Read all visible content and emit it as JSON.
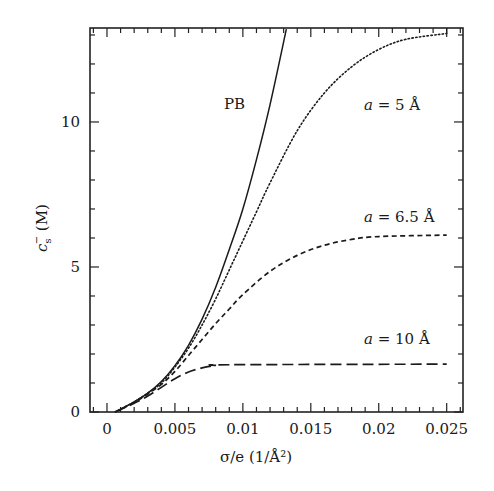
{
  "chart_data": {
    "type": "line",
    "title": "",
    "xlabel": "σ/e (1/Å²)",
    "ylabel": "c_s^− (M)",
    "xlim": [
      -0.00125,
      0.0262
    ],
    "ylim": [
      0,
      13.24
    ],
    "grid": false,
    "legend": "none (inline annotations)",
    "x_ticks": [
      0,
      0.005,
      0.01,
      0.015,
      0.02,
      0.025
    ],
    "x_tick_labels": [
      "0",
      "0.005",
      "0.01",
      "0.015",
      "0.02",
      "0.025"
    ],
    "x_minor_step": 0.001,
    "y_ticks": [
      0,
      5,
      10
    ],
    "y_tick_labels": [
      "0",
      "5",
      "10"
    ],
    "y_minor_step": 1,
    "series": [
      {
        "name": "PB",
        "style": "solid",
        "x": [
          0.0006,
          0.002,
          0.003,
          0.004,
          0.005,
          0.006,
          0.007,
          0.008,
          0.009,
          0.01,
          0.011,
          0.012,
          0.0132
        ],
        "y": [
          0,
          0.35,
          0.65,
          1.05,
          1.6,
          2.3,
          3.2,
          4.3,
          5.6,
          7.0,
          8.7,
          10.6,
          13.2
        ]
      },
      {
        "name": "a = 5 Å",
        "style": "dotted",
        "x": [
          0.0006,
          0.002,
          0.003,
          0.004,
          0.005,
          0.006,
          0.007,
          0.008,
          0.009,
          0.01,
          0.011,
          0.012,
          0.014,
          0.016,
          0.018,
          0.02,
          0.022,
          0.025
        ],
        "y": [
          0,
          0.35,
          0.65,
          1.0,
          1.55,
          2.2,
          3.0,
          3.9,
          4.9,
          5.9,
          6.9,
          7.9,
          9.7,
          11.0,
          11.9,
          12.5,
          12.85,
          13.05
        ]
      },
      {
        "name": "a = 6.5 Å",
        "style": "dashed",
        "x": [
          0.0006,
          0.002,
          0.003,
          0.004,
          0.005,
          0.006,
          0.007,
          0.008,
          0.009,
          0.01,
          0.012,
          0.014,
          0.016,
          0.018,
          0.02,
          0.025
        ],
        "y": [
          0,
          0.33,
          0.62,
          0.95,
          1.4,
          1.95,
          2.5,
          3.05,
          3.55,
          4.05,
          4.85,
          5.4,
          5.75,
          5.95,
          6.05,
          6.1
        ]
      },
      {
        "name": "a = 10 Å",
        "style": "long-dashed",
        "x": [
          0.0006,
          0.002,
          0.003,
          0.004,
          0.005,
          0.006,
          0.007,
          0.008,
          0.009,
          0.025
        ],
        "y": [
          0,
          0.3,
          0.55,
          0.85,
          1.15,
          1.38,
          1.52,
          1.6,
          1.63,
          1.65
        ]
      }
    ],
    "annotations": [
      {
        "text": "PB",
        "x": 0.00975,
        "y": 10.65
      },
      {
        "text": "a = 5 Å",
        "x": 0.0197,
        "y": 10.4
      },
      {
        "text": "a = 6.5 Å",
        "x": 0.0203,
        "y": 6.55
      },
      {
        "text": "a = 10 Å",
        "x": 0.0201,
        "y": 2.3
      }
    ]
  },
  "labels": {
    "xlabel": "σ/e (1/Å²)",
    "ylabel_main": "c",
    "ylabel_sub": "s",
    "ylabel_sup": "−",
    "ylabel_unit": " (M)",
    "ann_pb": "PB",
    "ann_a5_var": "a",
    "ann_a5_rest": " = 5 Å",
    "ann_a65_var": "a",
    "ann_a65_rest": " = 6.5 Å",
    "ann_a10_var": "a",
    "ann_a10_rest": " = 10 Å"
  }
}
